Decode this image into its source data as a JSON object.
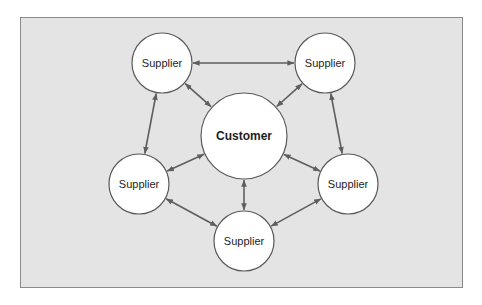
{
  "diagram": {
    "type": "network",
    "frame": {
      "x": 20,
      "y": 17,
      "width": 443,
      "height": 271,
      "fill": "#e4e4e4",
      "stroke": "#8a8a8a"
    },
    "colors": {
      "line": "#5e5e5e",
      "node_fill": "#ffffff",
      "node_stroke": "#5a5a5a",
      "text": "#1e1e1e"
    },
    "nodes": [
      {
        "id": "customer",
        "label": "Customer",
        "cx": 244,
        "cy": 136,
        "r": 43,
        "bold": true
      },
      {
        "id": "supplier_top_left",
        "label": "Supplier",
        "cx": 162,
        "cy": 63,
        "r": 30,
        "bold": false
      },
      {
        "id": "supplier_top_right",
        "label": "Supplier",
        "cx": 325,
        "cy": 63,
        "r": 30,
        "bold": false
      },
      {
        "id": "supplier_left",
        "label": "Supplier",
        "cx": 139,
        "cy": 184,
        "r": 30,
        "bold": false
      },
      {
        "id": "supplier_right",
        "label": "Supplier",
        "cx": 348,
        "cy": 184,
        "r": 30,
        "bold": false
      },
      {
        "id": "supplier_bottom",
        "label": "Supplier",
        "cx": 244,
        "cy": 241,
        "r": 30,
        "bold": false
      }
    ],
    "edges": [
      {
        "from": "supplier_top_left",
        "to": "supplier_top_right",
        "bidirectional": true
      },
      {
        "from": "supplier_top_right",
        "to": "supplier_right",
        "bidirectional": true
      },
      {
        "from": "supplier_right",
        "to": "supplier_bottom",
        "bidirectional": true
      },
      {
        "from": "supplier_bottom",
        "to": "supplier_left",
        "bidirectional": true
      },
      {
        "from": "supplier_left",
        "to": "supplier_top_left",
        "bidirectional": true
      },
      {
        "from": "customer",
        "to": "supplier_top_left",
        "bidirectional": true
      },
      {
        "from": "customer",
        "to": "supplier_top_right",
        "bidirectional": true
      },
      {
        "from": "customer",
        "to": "supplier_left",
        "bidirectional": true
      },
      {
        "from": "customer",
        "to": "supplier_right",
        "bidirectional": true
      },
      {
        "from": "customer",
        "to": "supplier_bottom",
        "bidirectional": true
      }
    ]
  }
}
